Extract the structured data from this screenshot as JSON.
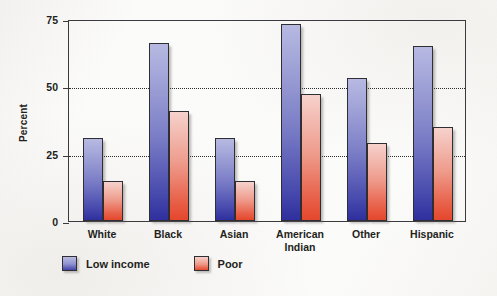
{
  "chart_data": {
    "type": "bar",
    "title": "",
    "xlabel": "",
    "ylabel": "Percent",
    "ylim": [
      0,
      75
    ],
    "yticks": [
      0,
      25,
      50,
      75
    ],
    "ytick_labels": [
      "0",
      "25",
      "50",
      "75"
    ],
    "gridlines": [
      25,
      50
    ],
    "grid": true,
    "legend_position": "below-left",
    "categories": [
      "White",
      "Black",
      "Asian",
      "American Indian",
      "Other",
      "Hispanic"
    ],
    "category_lines": [
      [
        "White"
      ],
      [
        "Black"
      ],
      [
        "Asian"
      ],
      [
        "American",
        "Indian"
      ],
      [
        "Other"
      ],
      [
        "Hispanic"
      ]
    ],
    "series": [
      {
        "name": "Low income",
        "color": "#5a5cbb",
        "values": [
          31,
          66,
          31,
          73,
          53,
          65
        ]
      },
      {
        "name": "Poor",
        "color": "#e8614a",
        "values": [
          15,
          41,
          15,
          47,
          29,
          35
        ]
      }
    ]
  },
  "axis": {
    "y_label": "Percent",
    "tick_0": "0",
    "tick_25": "25",
    "tick_50": "50",
    "tick_75": "75"
  },
  "legend": {
    "items": [
      {
        "label": "Low income",
        "swatch": "blue-swatch-icon"
      },
      {
        "label": "Poor",
        "swatch": "red-swatch-icon"
      }
    ]
  },
  "xlabels": [
    {
      "line1": "White",
      "line2": ""
    },
    {
      "line1": "Black",
      "line2": ""
    },
    {
      "line1": "Asian",
      "line2": ""
    },
    {
      "line1": "American",
      "line2": "Indian"
    },
    {
      "line1": "Other",
      "line2": ""
    },
    {
      "line1": "Hispanic",
      "line2": ""
    }
  ]
}
